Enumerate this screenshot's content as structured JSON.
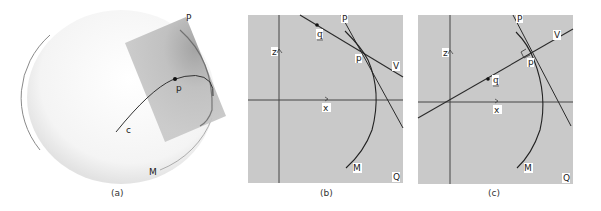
{
  "figure": {
    "panels": [
      {
        "id": "a",
        "caption": "(a)",
        "labels": {
          "plane": "P",
          "point": "p",
          "curve": "c",
          "surface": "M"
        }
      },
      {
        "id": "b",
        "caption": "(b)",
        "labels": {
          "plane": "P",
          "point": "p",
          "vector_q": "q",
          "vector_v": "V",
          "axis_z": "z",
          "axis_x": "x",
          "surface": "M",
          "region": "Q"
        }
      },
      {
        "id": "c",
        "caption": "(c)",
        "labels": {
          "plane": "P",
          "point": "p",
          "vector_q": "q",
          "vector_v": "V",
          "axis_z": "z",
          "axis_x": "x",
          "surface": "M",
          "region": "Q"
        }
      }
    ],
    "colors": {
      "panel_fill": "#c9c9c9",
      "plane_fill": "#bdbdbd",
      "line": "#2a2a2a",
      "sphere_stroke": "#9a9a9a"
    }
  }
}
